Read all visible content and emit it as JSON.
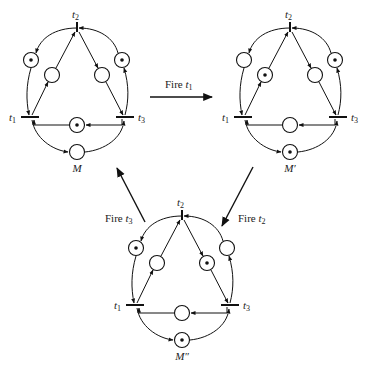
{
  "diagram": {
    "type": "petri-net-reachability",
    "nets": [
      {
        "id": "M",
        "label": "M",
        "offset": [
          0,
          0
        ],
        "transitions": {
          "t1": "t",
          "t2": "t",
          "t3": "t"
        },
        "tokens": {
          "outer_left": 1,
          "outer_right": 1,
          "inner_left": 0,
          "inner_right": 0,
          "bottom_mid": 1,
          "bottom": 0
        }
      },
      {
        "id": "M_prime",
        "label": "M′",
        "offset": [
          213,
          0
        ],
        "tokens": {
          "outer_left": 0,
          "outer_right": 1,
          "inner_left": 1,
          "inner_right": 0,
          "bottom_mid": 0,
          "bottom": 1
        }
      },
      {
        "id": "M_double_prime",
        "label": "M″",
        "offset": [
          105,
          188
        ],
        "tokens": {
          "outer_left": 1,
          "outer_right": 0,
          "inner_left": 0,
          "inner_right": 1,
          "bottom_mid": 0,
          "bottom": 1
        }
      }
    ],
    "transition_labels": {
      "t1": "t",
      "t1_sub": "1",
      "t2": "t",
      "t2_sub": "2",
      "t3": "t",
      "t3_sub": "3"
    },
    "arrows": [
      {
        "from": "M",
        "to": "M_prime",
        "label": "Fire",
        "sub": "1"
      },
      {
        "from": "M_prime",
        "to": "M_double_prime",
        "label": "Fire",
        "sub": "2"
      },
      {
        "from": "M_double_prime",
        "to": "M",
        "label": "Fire",
        "sub": "3"
      }
    ]
  }
}
